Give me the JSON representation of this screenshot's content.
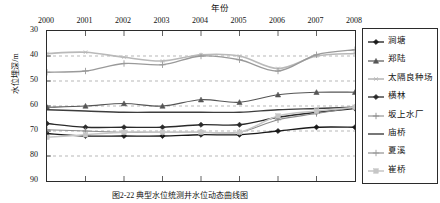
{
  "chart_data": {
    "type": "line",
    "title": "",
    "xlabel": "年份",
    "ylabel": "水位埋深/m",
    "caption": "图2-22 典型水位统测井水位动态曲线图",
    "categories": [
      "2000",
      "2001",
      "2002",
      "2003",
      "2004",
      "2005",
      "2006",
      "2007",
      "2008"
    ],
    "x": [
      2000,
      2001,
      2002,
      2003,
      2004,
      2005,
      2006,
      2007,
      2008
    ],
    "xlim": [
      2000,
      2008
    ],
    "ylim": [
      30,
      90
    ],
    "y_inverted": true,
    "yticks": [
      30,
      40,
      50,
      60,
      70,
      80,
      90
    ],
    "xticks": [
      2000,
      2001,
      2002,
      2003,
      2004,
      2005,
      2006,
      2007,
      2008
    ],
    "grid": "horizontal-dashed",
    "legend_position": "right-outside",
    "series": [
      {
        "name": "涧塘",
        "marker": "diamond",
        "color": "#1a1a1a",
        "width": 1.3,
        "values": [
          71.0,
          72.0,
          72.0,
          72.0,
          71.5,
          71.5,
          70.0,
          68.5,
          68.5
        ]
      },
      {
        "name": "郑陆",
        "marker": "triangle",
        "color": "#555555",
        "width": 1.2,
        "values": [
          60.5,
          60.0,
          59.0,
          60.0,
          57.5,
          58.5,
          55.5,
          54.5,
          54.5
        ]
      },
      {
        "name": "太隔良种场",
        "marker": "asterisk",
        "color": "#b9b9b9",
        "width": 1.6,
        "values": [
          39.0,
          38.5,
          40.5,
          42.0,
          39.5,
          40.0,
          45.0,
          40.0,
          39.0
        ]
      },
      {
        "name": "横林",
        "marker": "diamond",
        "color": "#2a2a2a",
        "width": 1.3,
        "values": [
          67.0,
          68.5,
          68.5,
          68.5,
          67.5,
          67.5,
          64.5,
          62.5,
          61.0
        ]
      },
      {
        "name": "坂上水厂",
        "marker": "plus",
        "color": "#8c8c8c",
        "width": 1.1,
        "values": [
          69.5,
          70.0,
          70.5,
          70.5,
          70.5,
          70.5,
          65.5,
          63.0,
          60.5
        ]
      },
      {
        "name": "庙桥",
        "marker": "line",
        "color": "#3d3d3d",
        "width": 1.4,
        "values": [
          61.5,
          62.0,
          62.5,
          62.5,
          62.5,
          62.5,
          61.5,
          61.0,
          60.5
        ]
      },
      {
        "name": "夏溪",
        "marker": "plus",
        "color": "#9a9a9a",
        "width": 1.3,
        "values": [
          46.5,
          46.0,
          43.0,
          43.5,
          40.0,
          41.5,
          46.0,
          39.5,
          37.5
        ]
      },
      {
        "name": "崔桥",
        "marker": "square",
        "color": "#c6c6c6",
        "width": 1.5,
        "values": [
          72.5,
          71.5,
          70.5,
          70.5,
          70.5,
          70.5,
          64.0,
          62.0,
          60.5
        ]
      }
    ]
  },
  "axis": {
    "x_title": "年份",
    "y_title": "水位埋深/m",
    "x_tick_labels": [
      "2000",
      "2001",
      "2002",
      "2003",
      "2004",
      "2005",
      "2006",
      "2007",
      "2008"
    ],
    "y_tick_labels": [
      "30",
      "40",
      "50",
      "60",
      "70",
      "80",
      "90"
    ]
  },
  "legend": {
    "items": [
      {
        "label": "涧塘"
      },
      {
        "label": "郑陆"
      },
      {
        "label": "太隔良种场"
      },
      {
        "label": "横林"
      },
      {
        "label": "坂上水厂"
      },
      {
        "label": "庙桥"
      },
      {
        "label": "夏溪"
      },
      {
        "label": "崔桥"
      }
    ]
  },
  "figure": {
    "caption": "图2-22 典型水位统测井水位动态曲线图"
  }
}
